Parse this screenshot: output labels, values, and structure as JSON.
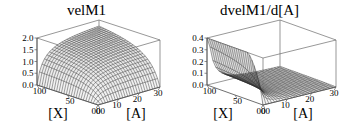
{
  "figure": {
    "background_color": "#ffffff",
    "width": 346,
    "height": 126,
    "panel_count": 2
  },
  "chart_data": [
    {
      "type": "surface",
      "panel": "left",
      "title": "velM1",
      "xlabel": "[X]",
      "ylabel": "[A]",
      "zlabel": "",
      "xlim": [
        0,
        100
      ],
      "ylim": [
        0,
        30
      ],
      "zlim": [
        0.0,
        2.0
      ],
      "x_ticks": [
        100,
        50,
        0
      ],
      "x_tick_labels": [
        "100",
        "50",
        "00"
      ],
      "y_ticks": [
        0,
        10,
        20,
        30
      ],
      "y_tick_labels": [
        "00",
        "10",
        "20",
        "30"
      ],
      "z_ticks": [
        0.0,
        0.5,
        1.0,
        1.5,
        2.0
      ],
      "z_tick_labels": [
        "0.0",
        "0.5",
        "1.0",
        "1.5",
        "2.0"
      ],
      "grid": false,
      "legend": false,
      "mesh_nx": 25,
      "mesh_ny": 25,
      "description": "Saturating dome-shaped reaction velocity surface; rises with [X] and [A], plateaus near 2.0",
      "z_max_observed": 2.0,
      "z_min_observed": 0.0,
      "surface_model": "vmax*x*a/((kx+x)*(ka+a))",
      "params": {
        "vmax": 2.35,
        "kx": 22,
        "ka": 3.2
      }
    },
    {
      "type": "surface",
      "panel": "right",
      "title": "dvelM1/d[A]",
      "xlabel": "[X]",
      "ylabel": "[A]",
      "zlabel": "",
      "xlim": [
        0,
        100
      ],
      "ylim": [
        0,
        30
      ],
      "zlim": [
        0.0,
        0.4
      ],
      "x_ticks": [
        100,
        50,
        0
      ],
      "x_tick_labels": [
        "100",
        "50",
        "00"
      ],
      "y_ticks": [
        0,
        10,
        20,
        30
      ],
      "y_tick_labels": [
        "00",
        "10",
        "20",
        "30"
      ],
      "z_ticks": [
        0.0,
        0.1,
        0.2,
        0.3,
        0.4
      ],
      "z_tick_labels": [
        "0.0",
        "0.1",
        "0.2",
        "0.3",
        "0.4"
      ],
      "grid": false,
      "legend": false,
      "mesh_nx": 25,
      "mesh_ny": 25,
      "description": "Partial derivative surface; sharp ridge near [A]=0 reaching about 0.35, decaying rapidly to near zero as [A] increases",
      "z_max_observed": 0.37,
      "z_min_observed": 0.0,
      "surface_model": "vmax*x*ka/((kx+x)*(ka+a)^2)",
      "params": {
        "vmax": 2.35,
        "kx": 22,
        "ka": 3.2
      }
    }
  ]
}
